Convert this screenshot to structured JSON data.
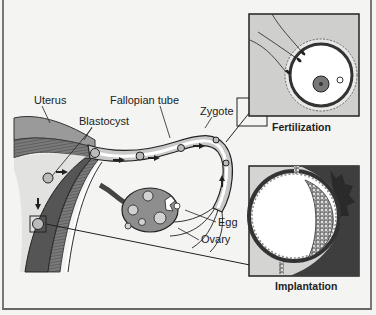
{
  "diagram": {
    "labels": {
      "uterus": "Uterus",
      "fallopian_tube": "Fallopian tube",
      "blastocyst": "Blastocyst",
      "zygote": "Zygote",
      "egg": "Egg",
      "ovary": "Ovary"
    },
    "insets": [
      {
        "id": "fertilization",
        "caption": "Fertilization"
      },
      {
        "id": "implantation",
        "caption": "Implantation"
      }
    ],
    "colors": {
      "background": "#f4f4f2",
      "tissue_dark": "#555555",
      "tissue_mid": "#8a8a8a",
      "tissue_light": "#c8c8c8",
      "outline": "#222222"
    }
  }
}
